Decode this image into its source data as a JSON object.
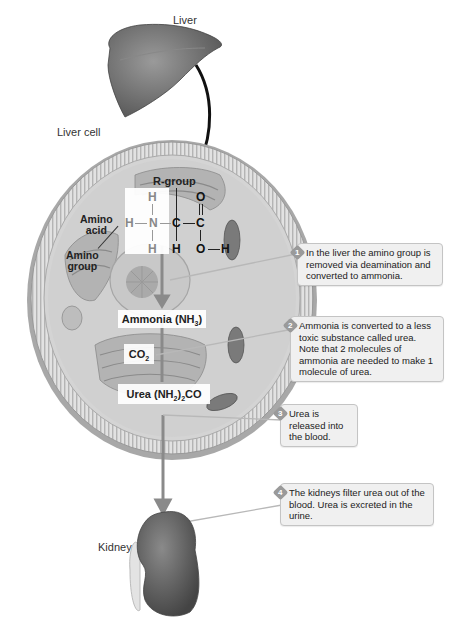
{
  "labels": {
    "liver": "Liver",
    "liver_cell": "Liver cell",
    "kidney": "Kidney"
  },
  "molecule": {
    "r_group": "R-group",
    "amino_acid_line1": "Amino",
    "amino_acid_line2": "acid",
    "amino_group_line1": "Amino",
    "amino_group_line2": "group",
    "atoms": {
      "h_top": "H",
      "h_left": "H",
      "n": "N",
      "h_bottom": "H",
      "c_alpha": "C",
      "h_alpha": "H",
      "c_carboxyl": "C",
      "o_double": "O",
      "o_single": "O",
      "h_hydroxyl": "H"
    }
  },
  "products": {
    "ammonia": "Ammonia (NH",
    "ammonia_sub": "3",
    "ammonia_close": ")",
    "co2": "CO",
    "co2_sub": "2",
    "urea": "Urea (NH",
    "urea_sub1": "2",
    "urea_mid": ")",
    "urea_sub2": "2",
    "urea_end": "CO"
  },
  "callouts": [
    {
      "step": "1",
      "text": "In the liver the amino group is removed via deamination and converted to ammonia."
    },
    {
      "step": "2",
      "text": "Ammonia is converted to a less toxic substance called urea. Note that 2 molecules of ammonia are needed to make 1 molecule of urea."
    },
    {
      "step": "3",
      "text": "Urea is released into the blood."
    },
    {
      "step": "4",
      "text": "The kidneys filter urea out of the blood. Urea is excreted in the urine."
    }
  ],
  "colors": {
    "organ": "#6e6e6e",
    "cell_membrane": "#c8c8c8",
    "cytoplasm": "#d6d6d6",
    "arrow": "#8a8a8a",
    "callout_bg": "#f0f0f0"
  }
}
